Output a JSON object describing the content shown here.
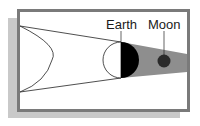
{
  "diagram": {
    "labels": {
      "earth": "Earth",
      "moon": "Moon"
    },
    "colors": {
      "backing_shadow": "#c9c9c9",
      "frame_border": "#7a7a7a",
      "frame_fill": "#ffffff",
      "umbra": "#8e8e8e",
      "earth_night": "#000000",
      "earth_day": "#ffffff",
      "moon": "#2a2a2a",
      "lines": "#222222"
    },
    "bodies": [
      {
        "name": "Sun",
        "shape": "arc",
        "label_visible": false
      },
      {
        "name": "Earth",
        "shape": "circle",
        "half_shaded": "right"
      },
      {
        "name": "Moon",
        "shape": "circle",
        "in_umbra": true
      }
    ]
  }
}
